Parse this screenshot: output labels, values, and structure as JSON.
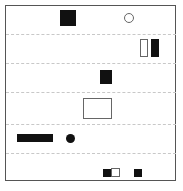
{
  "canvas": {
    "width": 183,
    "height": 191,
    "background": "#ffffff"
  },
  "frame": {
    "x": 5,
    "y": 5,
    "w": 171,
    "h": 176,
    "border_color": "#555555"
  },
  "separators": [
    34,
    63,
    92,
    124,
    153
  ],
  "colors": {
    "fill": "#111111",
    "outline": "#666666",
    "separator": "#c8c8c8"
  },
  "rows": [
    {
      "name": "row-1",
      "shapes": [
        {
          "kind": "square",
          "style": "filled",
          "x": 60,
          "y": 10,
          "w": 16,
          "h": 16
        },
        {
          "kind": "circle",
          "style": "outline",
          "x": 124,
          "y": 13,
          "w": 10,
          "h": 10
        }
      ]
    },
    {
      "name": "row-2",
      "shapes": [
        {
          "kind": "rect",
          "style": "outline",
          "x": 140,
          "y": 39,
          "w": 8,
          "h": 18
        },
        {
          "kind": "rect",
          "style": "filled",
          "x": 151,
          "y": 39,
          "w": 8,
          "h": 18
        }
      ]
    },
    {
      "name": "row-3",
      "shapes": [
        {
          "kind": "square",
          "style": "filled",
          "x": 100,
          "y": 70,
          "w": 12,
          "h": 14
        }
      ]
    },
    {
      "name": "row-4",
      "shapes": [
        {
          "kind": "rect",
          "style": "outline",
          "x": 83,
          "y": 98,
          "w": 29,
          "h": 21
        }
      ]
    },
    {
      "name": "row-5",
      "shapes": [
        {
          "kind": "bar",
          "style": "filled",
          "x": 17,
          "y": 134,
          "w": 36,
          "h": 8
        },
        {
          "kind": "circle",
          "style": "filled",
          "x": 66,
          "y": 134,
          "w": 9,
          "h": 9
        }
      ]
    },
    {
      "name": "row-6",
      "shapes": [
        {
          "kind": "square",
          "style": "filled",
          "x": 103,
          "y": 169,
          "w": 8,
          "h": 8
        },
        {
          "kind": "square",
          "style": "outline",
          "x": 111,
          "y": 168,
          "w": 9,
          "h": 9
        },
        {
          "kind": "square",
          "style": "filled",
          "x": 134,
          "y": 169,
          "w": 8,
          "h": 8
        }
      ]
    }
  ]
}
